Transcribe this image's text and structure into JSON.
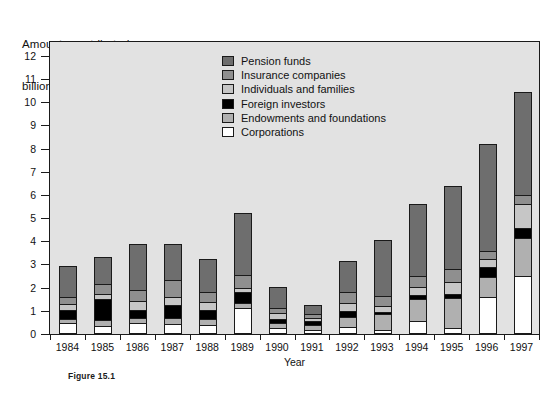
{
  "figure": {
    "caption": "Figure 15.1",
    "title_line_1": "Amounts contributed,",
    "title_line_2": "billions of dollars"
  },
  "legend": {
    "position": "top-center-inside",
    "items": [
      {
        "label": "Pension funds",
        "color": "#6e6e6e"
      },
      {
        "label": "Insurance companies",
        "color": "#8f8f8f"
      },
      {
        "label": "Individuals and families",
        "color": "#c6c6c6"
      },
      {
        "label": "Foreign investors",
        "color": "#000000"
      },
      {
        "label": "Endowments and foundations",
        "color": "#b0b0b0"
      },
      {
        "label": "Corporations",
        "color": "#ffffff"
      }
    ]
  },
  "chart_data": {
    "type": "bar",
    "stacked": true,
    "title": "Amounts contributed, billions of dollars",
    "xlabel": "Year",
    "ylabel": "Amounts contributed, billions of dollars",
    "ylim": [
      0,
      12.6
    ],
    "yticks": [
      0,
      1,
      2,
      3,
      4,
      5,
      6,
      7,
      8,
      9,
      10,
      11,
      12
    ],
    "ytick_labels": [
      "0",
      "1",
      "2",
      "3",
      "4",
      "5",
      "6",
      "7",
      "8",
      "9",
      "10",
      "11",
      "12"
    ],
    "grid": false,
    "categories": [
      "1984",
      "1985",
      "1986",
      "1987",
      "1988",
      "1989",
      "1990",
      "1991",
      "1992",
      "1993",
      "1994",
      "1995",
      "1996",
      "1997"
    ],
    "stack_order_bottom_to_top": [
      "Corporations",
      "Endowments and foundations",
      "Foreign investors",
      "Individuals and families",
      "Insurance companies",
      "Pension funds"
    ],
    "series": [
      {
        "name": "Corporations",
        "color": "#ffffff",
        "values": [
          0.45,
          0.3,
          0.45,
          0.4,
          0.35,
          1.1,
          0.2,
          0.15,
          0.25,
          0.15,
          0.5,
          0.2,
          1.55,
          2.45
        ]
      },
      {
        "name": "Endowments and foundations",
        "color": "#b0b0b0",
        "values": [
          0.15,
          0.25,
          0.2,
          0.25,
          0.25,
          0.2,
          0.25,
          0.2,
          0.45,
          0.65,
          0.95,
          1.3,
          0.85,
          1.65
        ]
      },
      {
        "name": "Foreign investors",
        "color": "#000000",
        "values": [
          0.4,
          0.9,
          0.35,
          0.55,
          0.4,
          0.45,
          0.15,
          0.15,
          0.25,
          0.1,
          0.2,
          0.2,
          0.45,
          0.45
        ]
      },
      {
        "name": "Individuals and families",
        "color": "#c6c6c6",
        "values": [
          0.25,
          0.25,
          0.4,
          0.35,
          0.35,
          0.2,
          0.25,
          0.15,
          0.35,
          0.25,
          0.35,
          0.5,
          0.35,
          1.0
        ]
      },
      {
        "name": "Insurance companies",
        "color": "#8f8f8f",
        "values": [
          0.3,
          0.4,
          0.45,
          0.75,
          0.4,
          0.55,
          0.25,
          0.15,
          0.45,
          0.45,
          0.45,
          0.55,
          0.35,
          0.4
        ]
      },
      {
        "name": "Pension funds",
        "color": "#6e6e6e",
        "values": [
          1.35,
          1.2,
          2.0,
          1.55,
          1.45,
          2.7,
          0.9,
          0.4,
          1.35,
          2.4,
          3.1,
          3.6,
          4.6,
          4.45
        ]
      }
    ],
    "totals": [
      2.9,
      3.3,
      3.85,
      3.85,
      3.2,
      5.2,
      2.0,
      1.2,
      3.1,
      4.0,
      5.55,
      6.35,
      8.15,
      10.4
    ]
  }
}
